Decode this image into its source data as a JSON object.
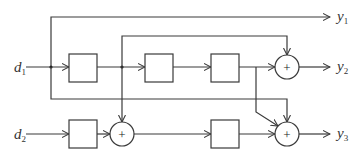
{
  "diagram": {
    "type": "block-diagram",
    "inputs": [
      {
        "id": "d1",
        "base": "d",
        "sub": "1"
      },
      {
        "id": "d2",
        "base": "d",
        "sub": "2"
      }
    ],
    "outputs": [
      {
        "id": "y1",
        "base": "y",
        "sub": "1"
      },
      {
        "id": "y2",
        "base": "y",
        "sub": "2"
      },
      {
        "id": "y3",
        "base": "y",
        "sub": "3"
      }
    ],
    "blocks": [
      {
        "id": "box1",
        "label": ""
      },
      {
        "id": "box2",
        "label": ""
      },
      {
        "id": "box3",
        "label": ""
      },
      {
        "id": "box4",
        "label": ""
      },
      {
        "id": "box5",
        "label": ""
      }
    ],
    "adders": [
      {
        "id": "adder-y2",
        "symbol": "+"
      },
      {
        "id": "adder-mid",
        "symbol": "+"
      },
      {
        "id": "adder-y3",
        "symbol": "+"
      }
    ],
    "connections": [
      "d1 -> y1",
      "d1 -> box1 -> box2 -> box3 -> adder-y2 -> y2",
      "box1 -> adder-y2",
      "box1 -> adder-mid",
      "d1 -> adder-y3",
      "box3 -> adder-y3",
      "d2 -> box4 -> adder-mid -> box5 -> adder-y3 -> y3"
    ]
  }
}
